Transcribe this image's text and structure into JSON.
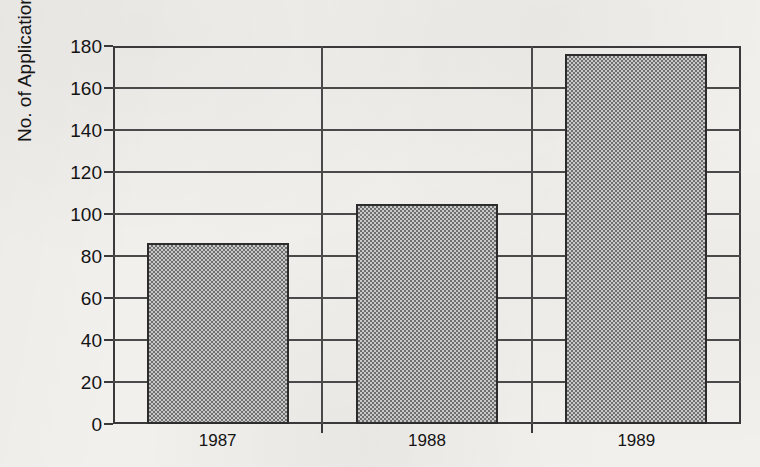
{
  "chart_data": {
    "type": "bar",
    "title": "",
    "subtitle": "",
    "xlabel": "",
    "ylabel": "No. of Applications (000)",
    "categories": [
      "1987",
      "1988",
      "1989"
    ],
    "values": [
      86,
      105,
      176
    ],
    "series": [
      {
        "name": "No. of Applications (000)",
        "values": [
          86,
          105,
          176
        ]
      }
    ],
    "ylim": [
      0,
      180
    ],
    "xlim": [
      0,
      3
    ],
    "y_ticks": [
      0,
      20,
      40,
      60,
      80,
      100,
      120,
      140,
      160,
      180
    ],
    "y_tick_labels": [
      "0",
      "20",
      "40",
      "60",
      "80",
      "100",
      "120",
      "140",
      "160",
      "180"
    ],
    "grid": "horizontal-and-category-separators",
    "legend": "none",
    "legend_position": "none",
    "annotations": [],
    "bar_fill": "#9a9a9a",
    "bar_edge": "#2c2c2c",
    "axis_color": "#3a3a3a",
    "grid_color": "#4a4a4a",
    "background": "#f2f0ed",
    "text_color": "#141414"
  },
  "axes": {
    "y_title": "No. of Applications (000)",
    "y_tick_labels": [
      "180",
      "160",
      "140",
      "120",
      "100",
      "80",
      "60",
      "40",
      "20",
      "0"
    ],
    "x_tick_labels": [
      "1987",
      "1988",
      "1989"
    ]
  }
}
